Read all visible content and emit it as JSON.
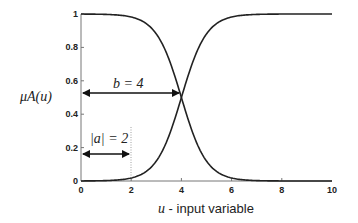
{
  "chart_data": {
    "type": "line",
    "title": "",
    "xlabel_var": "u",
    "xlabel_text": " - input variable",
    "ylabel": "μA(u)",
    "xlim": [
      0,
      10
    ],
    "ylim": [
      0,
      1
    ],
    "xticks": [
      "0",
      "2",
      "4",
      "6",
      "8",
      "10"
    ],
    "yticks": [
      "0",
      "0.2",
      "0.4",
      "0.6",
      "0.8",
      "1"
    ],
    "grid": false,
    "series": [
      {
        "name": "decreasing sigmoid",
        "a": -2,
        "b": 4,
        "x": [
          0,
          1,
          2,
          3,
          3.5,
          4,
          4.5,
          5,
          6,
          7,
          8,
          10
        ],
        "values": [
          1.0,
          1.0,
          0.98,
          0.88,
          0.73,
          0.5,
          0.27,
          0.12,
          0.02,
          0.0,
          0.0,
          0.0
        ]
      },
      {
        "name": "increasing sigmoid",
        "a": 2,
        "b": 4,
        "x": [
          0,
          1,
          2,
          3,
          3.5,
          4,
          4.5,
          5,
          6,
          7,
          8,
          10
        ],
        "values": [
          0.0,
          0.0,
          0.02,
          0.12,
          0.27,
          0.5,
          0.73,
          0.88,
          0.98,
          1.0,
          1.0,
          1.0
        ]
      }
    ],
    "annotations": [
      {
        "text": "b = 4",
        "type": "double-arrow",
        "from_x": 0,
        "to_x": 4,
        "y": 0.5
      },
      {
        "text": "|a| = 2",
        "type": "double-arrow",
        "from_x": 0,
        "to_x": 2,
        "y": 0.16
      },
      {
        "type": "dotted-vline",
        "x": 2
      }
    ]
  }
}
